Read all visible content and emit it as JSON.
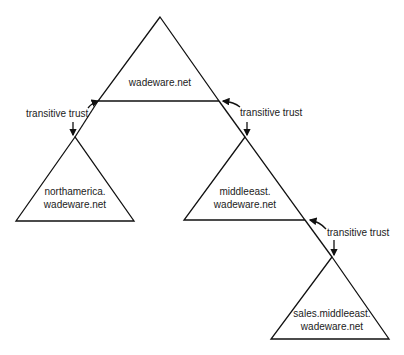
{
  "diagram": {
    "domains": [
      {
        "id": "root",
        "line1": "wadeware.net",
        "line2": ""
      },
      {
        "id": "northamerica",
        "line1": "northamerica.",
        "line2": "wadeware.net"
      },
      {
        "id": "middleeast",
        "line1": "middleeast.",
        "line2": "wadeware.net"
      },
      {
        "id": "sales",
        "line1": "sales.middleeast.",
        "line2": "wadeware.net"
      }
    ],
    "trusts": [
      {
        "label": "transitive trust",
        "between": [
          "wadeware.net",
          "northamerica.wadeware.net"
        ]
      },
      {
        "label": "transitive trust",
        "between": [
          "wadeware.net",
          "middleeast.wadeware.net"
        ]
      },
      {
        "label": "transitive trust",
        "between": [
          "middleeast.wadeware.net",
          "sales.middleeast.wadeware.net"
        ]
      }
    ]
  }
}
